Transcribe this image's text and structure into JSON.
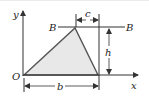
{
  "diagram": {
    "type": "geometry-triangle-dimensions",
    "labels": {
      "y_axis": "y",
      "x_axis": "x",
      "origin": "O",
      "line_left": "B",
      "line_right": "B",
      "offset": "c",
      "height": "h",
      "base": "b"
    },
    "colors": {
      "stroke": "#333333",
      "triangle_edge": "#555555",
      "fill": "#e8e8e8",
      "text": "#222222"
    }
  }
}
